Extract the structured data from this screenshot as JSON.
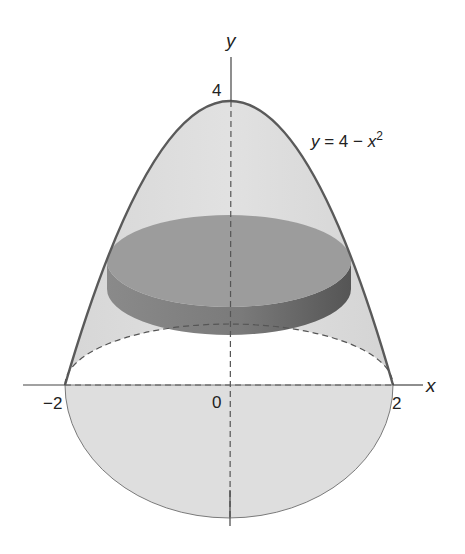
{
  "figure": {
    "curve_label": {
      "lhs": "y",
      "rhs": " = 4 − ",
      "var": "x",
      "exp": "2"
    },
    "axes": {
      "x_label": "x",
      "y_label": "y"
    },
    "ticks": {
      "x_neg": "−2",
      "origin": "0",
      "x_pos": "2",
      "y_top": "4"
    },
    "colors": {
      "solid_fill": "#d9d9d9",
      "solid_edge": "#5a5a5a",
      "disk_top": "#9a9a9a",
      "disk_side": "#6e6e6e",
      "axis": "#444444",
      "dashed": "#555555"
    }
  }
}
